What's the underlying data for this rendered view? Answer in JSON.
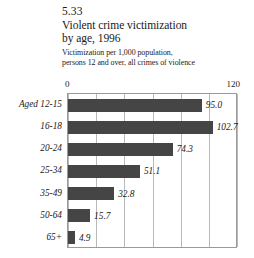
{
  "figure": {
    "number": "5.33",
    "title_lines": [
      "Violent crime victimization",
      "by age, 1996"
    ],
    "subtitle_lines": [
      "Victimization per 1,000 population,",
      "persons 12 and over, all crimes of violence"
    ]
  },
  "axis": {
    "min_label": "0",
    "max_label": "120"
  },
  "colors": {
    "bar": "#454545",
    "gridline": "#b9b9b9",
    "border": "#9a9a9a",
    "text": "#1a1a1a"
  },
  "chart_data": {
    "type": "bar",
    "orientation": "horizontal",
    "title": "5.33 Violent crime victimization by age, 1996",
    "subtitle": "Victimization per 1,000 population, persons 12 and over, all crimes of violence",
    "xlabel": "",
    "ylabel": "",
    "xlim": [
      0,
      120
    ],
    "xticks": [
      0,
      20,
      40,
      60,
      80,
      100,
      120
    ],
    "xtick_labels_shown": [
      "0",
      "120"
    ],
    "grid": true,
    "legend": false,
    "categories": [
      "Aged 12-15",
      "16-18",
      "20-24",
      "25-34",
      "35-49",
      "50-64",
      "65+"
    ],
    "values": [
      95.0,
      102.7,
      74.3,
      51.1,
      32.8,
      15.7,
      4.9
    ],
    "value_labels": [
      "95.0",
      "102.7",
      "74.3",
      "51.1",
      "32.8",
      "15.7",
      "4.9"
    ]
  }
}
